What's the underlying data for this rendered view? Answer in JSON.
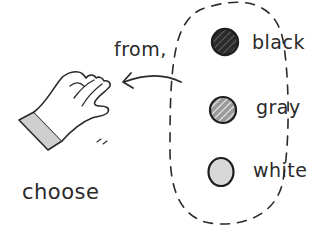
{
  "illustration": {
    "style": "hand-drawn sketch",
    "caption": "choose",
    "arrow_label": "from,",
    "options": [
      {
        "label": "black",
        "fill": "#2b2b2b",
        "pattern": "solid-dark-hatched"
      },
      {
        "label": "gray",
        "fill": "#9a9a9a",
        "pattern": "diagonal-hatch"
      },
      {
        "label": "white",
        "fill": "#d8d8d8",
        "pattern": "plain"
      }
    ],
    "colors": {
      "ink": "#2a2a2a",
      "sleeve": "#cfcfcf",
      "background": "#ffffff"
    }
  }
}
